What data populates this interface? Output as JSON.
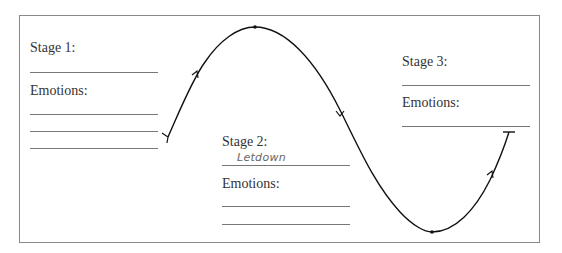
{
  "stages": [
    {
      "label": "Stage 1:",
      "answer": "",
      "emotions_label": "Emotions:",
      "emotion_lines": 3
    },
    {
      "label": "Stage 2:",
      "answer": "Letdown",
      "emotions_label": "Emotions:",
      "emotion_lines": 2
    },
    {
      "label": "Stage 3:",
      "answer": "",
      "emotions_label": "Emotions:",
      "emotion_lines": 1
    }
  ],
  "curve": {
    "description": "Emotional cycle curve: rises to a peak, falls to a trough, rises again",
    "color": "#111111"
  }
}
